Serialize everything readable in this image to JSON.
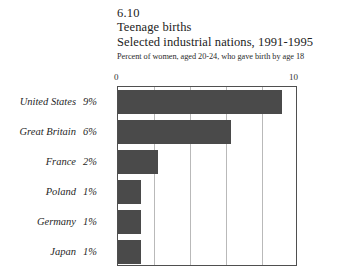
{
  "header": {
    "figure_number": "6.10",
    "title": "Teenage births",
    "subtitle": "Selected industrial nations, 1991-1995",
    "note": "Percent of women, aged 20-24, who gave birth by age 18"
  },
  "axis": {
    "min_label": "0",
    "max_label": "10"
  },
  "colors": {
    "bar_fill": "#4a4a4a",
    "frame": "#4f4f4f",
    "gridline": "#b9b9b9",
    "background": "#ffffff"
  },
  "chart_data": {
    "type": "bar",
    "orientation": "horizontal",
    "title": "Teenage births",
    "subtitle": "Selected industrial nations, 1991-1995",
    "figure_number": "6.10",
    "xlabel": "Percent of women, aged 20-24, who gave birth by age 18",
    "ylabel": "",
    "xlim": [
      0,
      10
    ],
    "xticks": [
      0,
      10
    ],
    "gridlines": [
      2,
      4,
      6,
      8
    ],
    "grid": true,
    "legend": "none",
    "categories": [
      "United States",
      "Great Britain",
      "France",
      "Poland",
      "Germany",
      "Japan"
    ],
    "values": [
      9.1,
      6.3,
      2.2,
      1.3,
      1.3,
      1.3
    ],
    "data_labels": [
      "9%",
      "6%",
      "2%",
      "1%",
      "1%",
      "1%"
    ],
    "rows": [
      {
        "category": "United States",
        "label": "9%",
        "value": 9.1
      },
      {
        "category": "Great Britain",
        "label": "6%",
        "value": 6.3
      },
      {
        "category": "France",
        "label": "2%",
        "value": 2.2
      },
      {
        "category": "Poland",
        "label": "1%",
        "value": 1.3
      },
      {
        "category": "Germany",
        "label": "1%",
        "value": 1.3
      },
      {
        "category": "Japan",
        "label": "1%",
        "value": 1.3
      }
    ]
  }
}
